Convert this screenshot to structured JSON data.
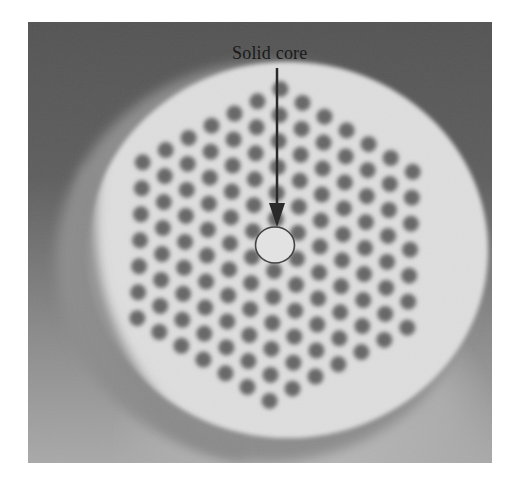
{
  "figure": {
    "annotation": {
      "label": "Solid core"
    },
    "colors": {
      "background_dark": "#575757",
      "fiber_face": "#dedede",
      "hole": "#666666",
      "annotation": "#2a2a2a"
    },
    "lattice": {
      "type": "hexagonal",
      "pitch": 26,
      "rotation_deg": -28,
      "center": [
        275,
        245
      ],
      "rings": 6,
      "hole_radius": 8
    },
    "core_marker": {
      "cx": 275,
      "cy": 245,
      "rx": 19.5,
      "ry": 18
    },
    "arrow": {
      "x": 277,
      "y_start": 68,
      "y_end": 226
    }
  }
}
